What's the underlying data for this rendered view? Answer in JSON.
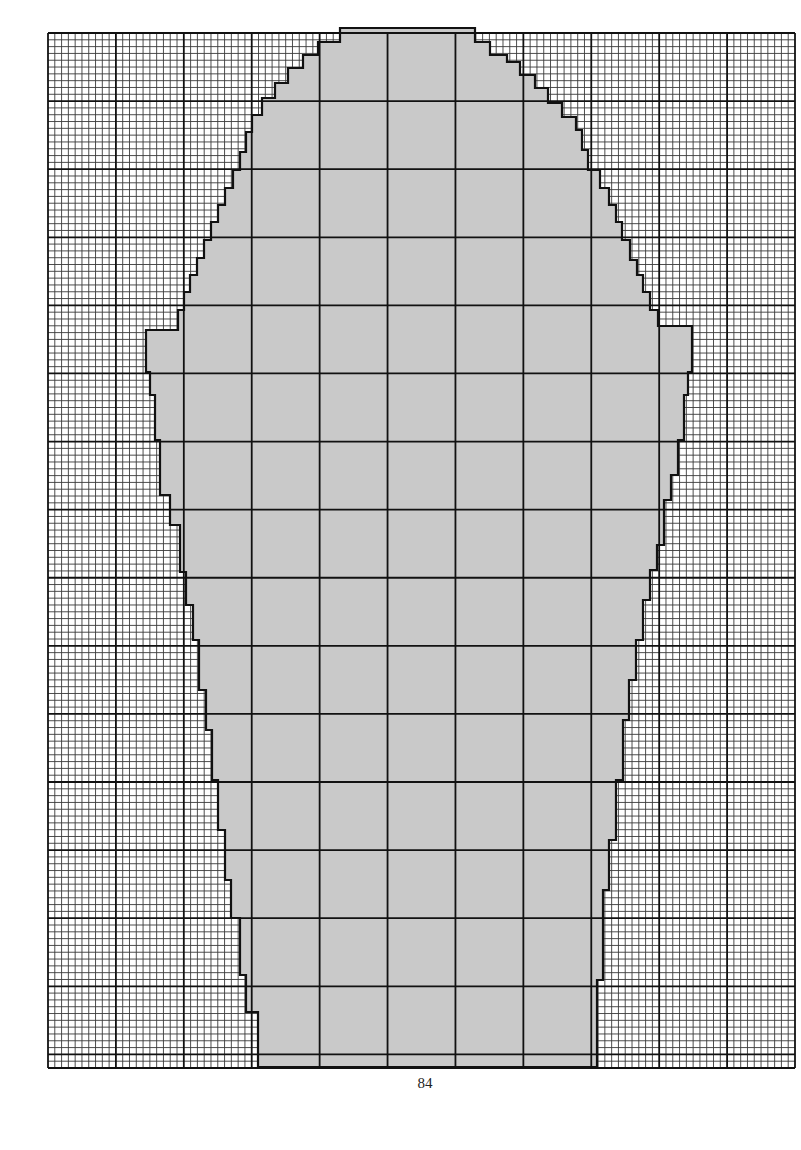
{
  "page": {
    "page_number": "84",
    "background": "#ffffff"
  },
  "grid": {
    "x0": 48,
    "y0": 33,
    "x1": 795,
    "y1": 1068,
    "cell": 6.8,
    "major_every": 10,
    "minor_color": "#3a3a3a",
    "major_color": "#111111",
    "minor_width": 0.9,
    "major_width": 1.8
  },
  "chart_data": {
    "type": "knitting-chart",
    "title": "",
    "shape": {
      "fill_light": "#c9c9c9",
      "fill_dark": "#8e8e8e",
      "outline_color": "#111111",
      "outline_width": 2.2,
      "outline_points": [
        [
          357,
          28
        ],
        [
          475,
          28
        ],
        [
          475,
          42
        ],
        [
          490,
          42
        ],
        [
          490,
          55
        ],
        [
          507,
          55
        ],
        [
          507,
          62
        ],
        [
          520,
          62
        ],
        [
          520,
          75
        ],
        [
          535,
          75
        ],
        [
          535,
          88
        ],
        [
          548,
          88
        ],
        [
          548,
          103
        ],
        [
          562,
          103
        ],
        [
          562,
          117
        ],
        [
          576,
          117
        ],
        [
          576,
          130
        ],
        [
          582,
          130
        ],
        [
          582,
          150
        ],
        [
          588,
          150
        ],
        [
          588,
          170
        ],
        [
          600,
          170
        ],
        [
          600,
          188
        ],
        [
          609,
          188
        ],
        [
          609,
          205
        ],
        [
          616,
          205
        ],
        [
          616,
          222
        ],
        [
          622,
          222
        ],
        [
          622,
          240
        ],
        [
          630,
          240
        ],
        [
          630,
          260
        ],
        [
          637,
          260
        ],
        [
          637,
          275
        ],
        [
          643,
          275
        ],
        [
          643,
          292
        ],
        [
          650,
          292
        ],
        [
          650,
          310
        ],
        [
          658,
          310
        ],
        [
          658,
          326
        ],
        [
          692,
          326
        ],
        [
          692,
          372
        ],
        [
          688,
          372
        ],
        [
          688,
          395
        ],
        [
          684,
          395
        ],
        [
          684,
          440
        ],
        [
          678,
          440
        ],
        [
          678,
          475
        ],
        [
          671,
          475
        ],
        [
          671,
          500
        ],
        [
          664,
          500
        ],
        [
          664,
          545
        ],
        [
          657,
          545
        ],
        [
          657,
          570
        ],
        [
          650,
          570
        ],
        [
          650,
          600
        ],
        [
          643,
          600
        ],
        [
          643,
          640
        ],
        [
          636,
          640
        ],
        [
          636,
          680
        ],
        [
          629,
          680
        ],
        [
          629,
          720
        ],
        [
          623,
          720
        ],
        [
          623,
          780
        ],
        [
          616,
          780
        ],
        [
          616,
          840
        ],
        [
          609,
          840
        ],
        [
          609,
          890
        ],
        [
          603,
          890
        ],
        [
          603,
          980
        ],
        [
          597,
          980
        ],
        [
          597,
          1067
        ],
        [
          258,
          1067
        ],
        [
          258,
          1012
        ],
        [
          246,
          1012
        ],
        [
          246,
          975
        ],
        [
          240,
          975
        ],
        [
          240,
          918
        ],
        [
          231,
          918
        ],
        [
          231,
          880
        ],
        [
          225,
          880
        ],
        [
          225,
          830
        ],
        [
          218,
          830
        ],
        [
          218,
          780
        ],
        [
          212,
          780
        ],
        [
          212,
          730
        ],
        [
          206,
          730
        ],
        [
          206,
          690
        ],
        [
          199,
          690
        ],
        [
          199,
          640
        ],
        [
          193,
          640
        ],
        [
          193,
          605
        ],
        [
          186,
          605
        ],
        [
          186,
          572
        ],
        [
          180,
          572
        ],
        [
          180,
          525
        ],
        [
          170,
          525
        ],
        [
          170,
          495
        ],
        [
          160,
          495
        ],
        [
          160,
          440
        ],
        [
          155,
          440
        ],
        [
          155,
          395
        ],
        [
          150,
          395
        ],
        [
          150,
          372
        ],
        [
          146,
          372
        ],
        [
          146,
          330
        ],
        [
          178,
          330
        ],
        [
          178,
          310
        ],
        [
          184,
          310
        ],
        [
          184,
          292
        ],
        [
          190,
          292
        ],
        [
          190,
          275
        ],
        [
          197,
          275
        ],
        [
          197,
          258
        ],
        [
          204,
          258
        ],
        [
          204,
          240
        ],
        [
          211,
          240
        ],
        [
          211,
          222
        ],
        [
          218,
          222
        ],
        [
          218,
          205
        ],
        [
          225,
          205
        ],
        [
          225,
          188
        ],
        [
          233,
          188
        ],
        [
          233,
          170
        ],
        [
          240,
          170
        ],
        [
          240,
          152
        ],
        [
          246,
          152
        ],
        [
          246,
          132
        ],
        [
          252,
          132
        ],
        [
          252,
          115
        ],
        [
          262,
          115
        ],
        [
          262,
          98
        ],
        [
          275,
          98
        ],
        [
          275,
          83
        ],
        [
          288,
          83
        ],
        [
          288,
          68
        ],
        [
          303,
          68
        ],
        [
          303,
          55
        ],
        [
          318,
          55
        ],
        [
          318,
          42
        ],
        [
          340,
          42
        ],
        [
          340,
          28
        ]
      ],
      "lattice": {
        "spacing": 102,
        "origin_x": 416,
        "origin_y": 30,
        "dot_color": "#111111",
        "dot_radius": 1.9,
        "dot_step": 9.5
      },
      "hatch": {
        "color": "#3b3b3b",
        "spacing": 4,
        "width": 1.1
      }
    }
  }
}
